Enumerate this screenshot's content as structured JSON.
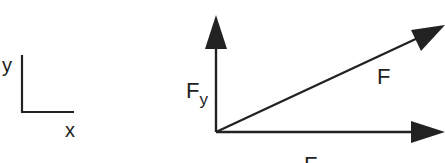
{
  "diagram": {
    "type": "vector-decomposition",
    "colors": {
      "stroke": "#222222",
      "background": "#ffffff"
    },
    "axes_legend": {
      "x_label": "x",
      "y_label": "y"
    },
    "vectors": {
      "resultant": {
        "label": "F"
      },
      "y_component": {
        "label_main": "F",
        "label_sub": "y"
      },
      "x_component": {
        "label_main": "F",
        "label_sub": "x"
      }
    }
  }
}
